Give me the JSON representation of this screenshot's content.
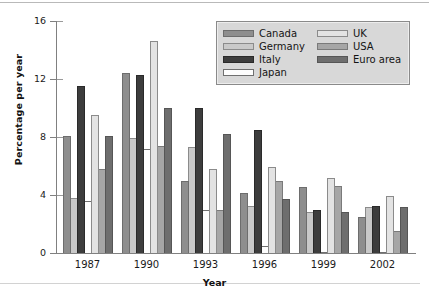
{
  "chart_data": {
    "type": "bar",
    "title": "",
    "xlabel": "Year",
    "ylabel": "Percentage per year",
    "categories": [
      "1987",
      "1990",
      "1993",
      "1996",
      "1999",
      "2002"
    ],
    "ylim": [
      0,
      16
    ],
    "yticks": [
      0,
      4,
      8,
      12,
      16
    ],
    "ytick_labels": [
      "0",
      "4",
      "8",
      "12",
      "16"
    ],
    "grid": false,
    "legend_position": "top-right",
    "series": [
      {
        "name": "Canada",
        "color": "#8e8e8e",
        "values": [
          8.1,
          12.4,
          5.0,
          4.15,
          4.55,
          2.5
        ]
      },
      {
        "name": "Germany",
        "color": "#c9c9c9",
        "values": [
          3.8,
          7.9,
          7.3,
          3.25,
          2.8,
          3.2
        ]
      },
      {
        "name": "Italy",
        "color": "#3d3d3d",
        "values": [
          11.5,
          12.3,
          10.0,
          8.5,
          3.0,
          3.25
        ]
      },
      {
        "name": "Japan",
        "color": "#fdfdfd",
        "values": [
          3.6,
          7.2,
          3.0,
          0.45,
          0.1,
          0.05
        ]
      },
      {
        "name": "UK",
        "color": "#e3e3e3",
        "values": [
          9.5,
          14.6,
          5.8,
          5.9,
          5.15,
          3.9
        ]
      },
      {
        "name": "USA",
        "color": "#a6a6a6",
        "values": [
          5.8,
          7.4,
          3.0,
          5.0,
          4.6,
          1.5
        ]
      },
      {
        "name": "Euro area",
        "color": "#6e6e6e",
        "values": [
          8.05,
          10.0,
          8.2,
          3.7,
          2.8,
          3.15
        ]
      }
    ]
  },
  "legend": {
    "left_column": [
      "Canada",
      "Germany",
      "Italy",
      "Japan"
    ],
    "right_column": [
      "UK",
      "USA",
      "Euro area"
    ]
  }
}
